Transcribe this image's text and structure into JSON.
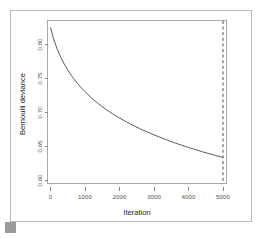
{
  "figure": {
    "background_color": "#ffffff",
    "frame_color": "#b9b9b9",
    "corner_marker_color": "#9a9a9a"
  },
  "chart_data": {
    "type": "line",
    "title": "",
    "subtitle": "",
    "xlabel": "Iteration",
    "ylabel": "Bernoulli deviance",
    "xlim": [
      0,
      5000
    ],
    "ylim": [
      0.585,
      0.832
    ],
    "xticks": [
      0,
      1000,
      2000,
      3000,
      4000,
      5000
    ],
    "xticklabels": [
      "0",
      "1000",
      "2000",
      "3000",
      "4000",
      "5000"
    ],
    "yticks": [
      0.6,
      0.65,
      0.7,
      0.75,
      0.8
    ],
    "yticklabels": [
      "0.60",
      "0.65",
      "0.70",
      "0.75",
      "0.80"
    ],
    "grid": false,
    "legend": false,
    "legend_position": "none",
    "line_color": "#4a4a4a",
    "series": [
      {
        "name": "Bernoulli deviance",
        "x": [
          0,
          100,
          200,
          300,
          400,
          500,
          600,
          700,
          800,
          900,
          1000,
          1200,
          1400,
          1600,
          1800,
          2000,
          2200,
          2400,
          2600,
          2800,
          3000,
          3200,
          3400,
          3600,
          3800,
          4000,
          4200,
          4400,
          4600,
          4800,
          5000
        ],
        "values": [
          0.825,
          0.8065,
          0.7925,
          0.781,
          0.7712,
          0.7626,
          0.7549,
          0.748,
          0.7417,
          0.7359,
          0.7305,
          0.7209,
          0.7124,
          0.7049,
          0.6981,
          0.6919,
          0.6862,
          0.6809,
          0.676,
          0.6714,
          0.6671,
          0.663,
          0.6591,
          0.6554,
          0.6519,
          0.6486,
          0.6454,
          0.6423,
          0.6394,
          0.6366,
          0.6339
        ]
      }
    ],
    "annotations": [
      {
        "name": "optimal-iteration-line",
        "type": "vertical-dashed-line",
        "x": 5000,
        "color": "#3a3a3a",
        "label": ""
      }
    ]
  }
}
